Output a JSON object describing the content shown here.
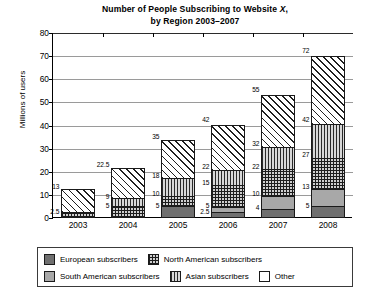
{
  "chart_data": {
    "type": "bar",
    "title": "Number of People Subscribing to Website X, by Region 2003–2007",
    "title_line1": "Number of People Subscribing to Website",
    "title_line1_italic": "X",
    "title_line1_tail": ",",
    "title_line2": "by Region 2003–2007",
    "xlabel": "",
    "ylabel": "Millions of users",
    "ylim": [
      0,
      80
    ],
    "ytick_labels": [
      "0",
      "10",
      "20",
      "30",
      "40",
      "50",
      "60",
      "70",
      "80"
    ],
    "ytick_values": [
      0,
      10,
      20,
      30,
      40,
      50,
      60,
      70,
      80
    ],
    "grid": true,
    "legend_position": "bottom",
    "stacked": true,
    "categories": [
      "2003",
      "2004",
      "2005",
      "2006",
      "2007",
      "2008"
    ],
    "series": [
      {
        "name": "European subscribers",
        "key": "european",
        "pattern": "solid-dark-gray",
        "values": [
          0,
          0,
          5,
          2.5,
          4,
          5
        ]
      },
      {
        "name": "South American subscribers",
        "key": "south",
        "pattern": "solid-mid-gray",
        "values": [
          0,
          0,
          0,
          2.5,
          6,
          8
        ]
      },
      {
        "name": "North American subscribers",
        "key": "north",
        "pattern": "crosshatch",
        "values": [
          2.5,
          5,
          5,
          10,
          12,
          14
        ]
      },
      {
        "name": "Asian subscribers",
        "key": "asian",
        "pattern": "vertical-lines",
        "values": [
          0,
          4,
          8,
          7,
          10,
          15
        ]
      },
      {
        "name": "Other",
        "key": "other",
        "pattern": "diagonal-hatch",
        "values": [
          10.5,
          13.5,
          17,
          20,
          23,
          30
        ]
      }
    ],
    "cumulative_labels": [
      {
        "category": "2003",
        "labels": [
          {
            "value": "2.5",
            "at": 2.5
          },
          {
            "value": "13",
            "at": 13
          }
        ]
      },
      {
        "category": "2004",
        "labels": [
          {
            "value": "5",
            "at": 5
          },
          {
            "value": "9",
            "at": 9
          },
          {
            "value": "22.5",
            "at": 22.5
          }
        ]
      },
      {
        "category": "2005",
        "labels": [
          {
            "value": "5",
            "at": 5
          },
          {
            "value": "10",
            "at": 10
          },
          {
            "value": "18",
            "at": 18
          },
          {
            "value": "35",
            "at": 35
          }
        ]
      },
      {
        "category": "2006",
        "labels": [
          {
            "value": "2.5",
            "at": 2.5
          },
          {
            "value": "5",
            "at": 5
          },
          {
            "value": "15",
            "at": 15
          },
          {
            "value": "22",
            "at": 22
          },
          {
            "value": "42",
            "at": 42
          }
        ]
      },
      {
        "category": "2007",
        "labels": [
          {
            "value": "4",
            "at": 4
          },
          {
            "value": "10",
            "at": 10
          },
          {
            "value": "22",
            "at": 22
          },
          {
            "value": "32",
            "at": 32
          },
          {
            "value": "55",
            "at": 55
          }
        ]
      },
      {
        "category": "2008",
        "labels": [
          {
            "value": "5",
            "at": 5
          },
          {
            "value": "13",
            "at": 13
          },
          {
            "value": "27",
            "at": 27
          },
          {
            "value": "42",
            "at": 42
          },
          {
            "value": "72",
            "at": 72
          }
        ]
      }
    ],
    "totals": [
      13,
      22.5,
      35,
      42,
      55,
      72
    ]
  },
  "legend": {
    "row1": [
      {
        "label": "European subscribers",
        "key": "european"
      },
      {
        "label": "North American subscribers",
        "key": "north"
      }
    ],
    "row2": [
      {
        "label": "South American subscribers",
        "key": "south"
      },
      {
        "label": "Asian subscribers",
        "key": "asian"
      },
      {
        "label": "Other",
        "key": "other"
      }
    ]
  },
  "colors": {
    "european": "#6f6f6f",
    "south": "#a8a8a8",
    "north": "#cfcfcf",
    "asian": "#d8d8d8",
    "other": "#ffffff",
    "axis": "#000000",
    "grid": "#9a9a9a"
  }
}
